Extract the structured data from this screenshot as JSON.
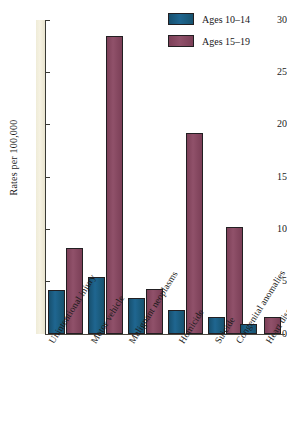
{
  "chart_data": {
    "type": "bar",
    "title": "",
    "xlabel": "",
    "ylabel": "Rates per 100,000",
    "ylim": [
      0,
      30
    ],
    "yticks": [
      0,
      5,
      10,
      15,
      20,
      25,
      30
    ],
    "grid": false,
    "legend_position": "top-right",
    "categories": [
      "Unintentional injury",
      "Motor vehicle",
      "Malignant neoplasms",
      "Homicide",
      "Suicide",
      "Congenital anomalies",
      "Heart diseases"
    ],
    "series": [
      {
        "name": "Ages 10–14",
        "color": "#1f6690",
        "values": [
          4.2,
          5.4,
          3.4,
          2.3,
          1.6,
          1.0,
          0.0
        ]
      },
      {
        "name": "Ages 15–19",
        "color": "#90516a",
        "values": [
          8.2,
          28.5,
          4.3,
          19.2,
          10.2,
          0.0,
          1.6
        ]
      }
    ]
  },
  "axis": {
    "y_title": "Rates per 100,000",
    "y_tick_labels": [
      "0",
      "5",
      "10",
      "15",
      "20",
      "25",
      "30"
    ]
  },
  "legend": {
    "items": [
      {
        "label": "Ages 10–14",
        "color": "#1f6690"
      },
      {
        "label": "Ages 15–19",
        "color": "#90516a"
      }
    ]
  }
}
